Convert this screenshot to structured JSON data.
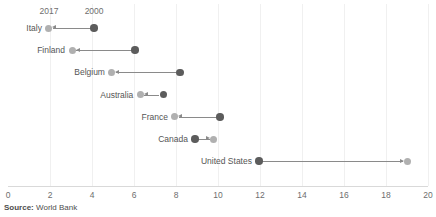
{
  "chart_data": {
    "type": "scatter",
    "variant": "dumbbell-arrow",
    "title": "",
    "xlabel": "",
    "ylabel": "",
    "xlim": [
      0,
      20
    ],
    "xticks": [
      0,
      2,
      4,
      6,
      8,
      10,
      12,
      14,
      16,
      18,
      20
    ],
    "xtick_labels": [
      "0",
      "2",
      "4",
      "6",
      "8",
      "10",
      "12",
      "14",
      "16",
      "18",
      "20"
    ],
    "grid": "vertical-light",
    "legend_position": "inline-top-annotations",
    "series": [
      {
        "name": "2017",
        "color": "#b0b0b0",
        "values": [
          1.95,
          3.05,
          4.95,
          6.3,
          7.95,
          9.8,
          19.0
        ]
      },
      {
        "name": "2000",
        "color": "#5c5c5c",
        "values": [
          4.1,
          6.05,
          8.2,
          7.4,
          10.1,
          8.9,
          11.95
        ]
      }
    ],
    "categories": [
      "Italy",
      "Finland",
      "Belgium",
      "Australia",
      "France",
      "Canada",
      "United States"
    ],
    "annotations": [
      {
        "text": "2017",
        "x": 1.95,
        "series": "2017"
      },
      {
        "text": "2000",
        "x": 4.1,
        "series": "2000"
      }
    ],
    "rows": [
      {
        "label": "Italy",
        "start": 4.1,
        "end": 1.95,
        "direction": "left"
      },
      {
        "label": "Finland",
        "start": 6.05,
        "end": 3.05,
        "direction": "left"
      },
      {
        "label": "Belgium",
        "start": 8.2,
        "end": 4.95,
        "direction": "left"
      },
      {
        "label": "Australia",
        "start": 7.4,
        "end": 6.3,
        "direction": "left"
      },
      {
        "label": "France",
        "start": 10.1,
        "end": 7.95,
        "direction": "left"
      },
      {
        "label": "Canada",
        "start": 8.9,
        "end": 9.8,
        "direction": "right"
      },
      {
        "label": "United States",
        "start": 11.95,
        "end": 19.0,
        "direction": "right"
      }
    ]
  },
  "footer": {
    "source_prefix": "Source:",
    "source_value": "World Bank"
  }
}
